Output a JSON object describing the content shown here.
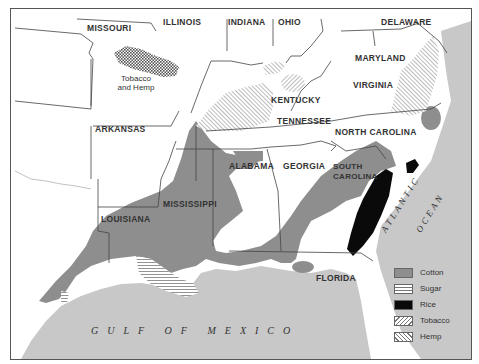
{
  "map": {
    "colors": {
      "water": "#c8c8c8",
      "land": "#ffffff",
      "cotton": "#8e8e8e",
      "rice": "#0a0a0a",
      "border": "#444444"
    },
    "states": [
      {
        "id": "missouri",
        "label": "MISSOURI"
      },
      {
        "id": "illinois",
        "label": "ILLINOIS"
      },
      {
        "id": "indiana",
        "label": "INDIANA"
      },
      {
        "id": "ohio",
        "label": "OHIO"
      },
      {
        "id": "delaware",
        "label": "DELAWARE"
      },
      {
        "id": "maryland",
        "label": "MARYLAND"
      },
      {
        "id": "virginia",
        "label": "VIRGINIA"
      },
      {
        "id": "kentucky",
        "label": "KENTUCKY"
      },
      {
        "id": "tennessee",
        "label": "TENNESSEE"
      },
      {
        "id": "north-carolina",
        "label": "NORTH CAROLINA"
      },
      {
        "id": "arkansas",
        "label": "ARKANSAS"
      },
      {
        "id": "alabama",
        "label": "ALABAMA"
      },
      {
        "id": "georgia",
        "label": "GEORGIA"
      },
      {
        "id": "south-carolina",
        "label": "SOUTH CAROLINA"
      },
      {
        "id": "mississippi",
        "label": "MISSISSIPPI"
      },
      {
        "id": "louisiana",
        "label": "LOUISIANA"
      },
      {
        "id": "florida",
        "label": "FLORIDA"
      }
    ],
    "south_carolina_lines": [
      "SOUTH",
      "CAROLINA"
    ],
    "annotations": {
      "tobacco_hemp_line1": "Tobacco",
      "tobacco_hemp_line2": "and Hemp"
    },
    "water_labels": {
      "gulf": "GULF OF MEXICO",
      "atlantic": "ATLANTIC",
      "ocean": "OCEAN"
    },
    "legend": [
      {
        "id": "cotton",
        "label": "Cotton",
        "pattern": "solid-gray"
      },
      {
        "id": "sugar",
        "label": "Sugar",
        "pattern": "horizontal-lines"
      },
      {
        "id": "rice",
        "label": "Rice",
        "pattern": "solid-black"
      },
      {
        "id": "tobacco",
        "label": "Tobacco",
        "pattern": "diagonal-lines"
      },
      {
        "id": "hemp",
        "label": "Hemp",
        "pattern": "reverse-diagonal-lines"
      }
    ]
  }
}
